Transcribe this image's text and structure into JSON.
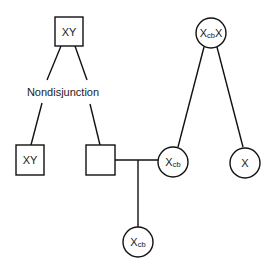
{
  "diagram": {
    "type": "pedigree",
    "annotation": "Nondisjunction",
    "nodes": {
      "grandfather": {
        "shape": "square",
        "label": "XY"
      },
      "grandmother": {
        "shape": "circle",
        "label_main": "X",
        "label_sub": "cb",
        "label_tail": "X"
      },
      "son_xy": {
        "shape": "square",
        "label": "XY"
      },
      "son_nullo": {
        "shape": "square",
        "label": ""
      },
      "daughter_carrier": {
        "shape": "circle",
        "label_main": "X",
        "label_sub": "cb"
      },
      "daughter_x": {
        "shape": "circle",
        "label_main": "X"
      },
      "grandchild": {
        "shape": "circle",
        "label_main": "X",
        "label_sub": "cb"
      }
    },
    "colors": {
      "stroke": "#111111",
      "background": "#ffffff",
      "text": "#222222"
    }
  }
}
